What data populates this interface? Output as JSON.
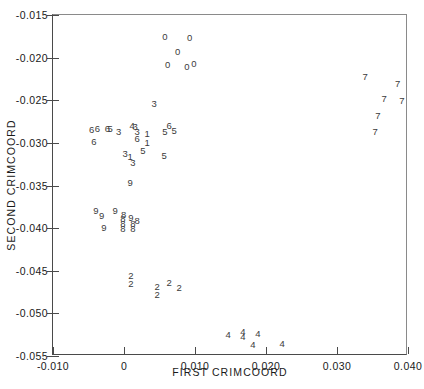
{
  "chart_data": {
    "type": "scatter",
    "title": "",
    "xlabel": "FIRST CRIMCOORD",
    "ylabel": "SECOND CRIMCOORD",
    "xlim": [
      -0.01,
      0.04
    ],
    "ylim": [
      -0.055,
      -0.015
    ],
    "xticks": [
      -0.01,
      0.0,
      0.01,
      0.02,
      0.03,
      0.04
    ],
    "xticklabels": [
      "-0.010",
      "0",
      "0.010",
      "0.020",
      "0.030",
      "0.040"
    ],
    "yticks": [
      -0.015,
      -0.02,
      -0.025,
      -0.03,
      -0.035,
      -0.04,
      -0.045,
      -0.05,
      -0.055
    ],
    "yticklabels": [
      "-0.015",
      "-0.020",
      "-0.025",
      "-0.030",
      "-0.035",
      "-0.040",
      "-0.045",
      "-0.050",
      "-0.055"
    ],
    "grid": false,
    "legend": false,
    "marker_style": "group-digit-label",
    "groups": [
      "0",
      "1",
      "2",
      "3",
      "4",
      "5",
      "6",
      "7",
      "8",
      "9"
    ],
    "points": [
      {
        "label": "0",
        "x": 0.0059,
        "y": -0.01765
      },
      {
        "label": "0",
        "x": 0.0094,
        "y": -0.01777
      },
      {
        "label": "0",
        "x": 0.0077,
        "y": -0.01942
      },
      {
        "label": "0",
        "x": 0.0063,
        "y": -0.02094
      },
      {
        "label": "0",
        "x": 0.009,
        "y": -0.02118
      },
      {
        "label": "0",
        "x": 0.01,
        "y": -0.02083
      },
      {
        "label": "3",
        "x": 0.0044,
        "y": -0.02552
      },
      {
        "label": "6",
        "x": -0.0044,
        "y": -0.02864
      },
      {
        "label": "6",
        "x": -0.0036,
        "y": -0.02845
      },
      {
        "label": "6",
        "x": -0.0022,
        "y": -0.02845
      },
      {
        "label": "5",
        "x": -0.0018,
        "y": -0.02845
      },
      {
        "label": "3",
        "x": -0.0006,
        "y": -0.02881
      },
      {
        "label": "4",
        "x": 0.0013,
        "y": -0.0281
      },
      {
        "label": "3",
        "x": 0.0017,
        "y": -0.02822
      },
      {
        "label": "3",
        "x": 0.002,
        "y": -0.02881
      },
      {
        "label": "1",
        "x": 0.0034,
        "y": -0.02905
      },
      {
        "label": "5",
        "x": 0.0059,
        "y": -0.02881
      },
      {
        "label": "6",
        "x": 0.0065,
        "y": -0.0281
      },
      {
        "label": "5",
        "x": 0.0072,
        "y": -0.02869
      },
      {
        "label": "6",
        "x": -0.0041,
        "y": -0.02998
      },
      {
        "label": "6",
        "x": 0.002,
        "y": -0.02963
      },
      {
        "label": "1",
        "x": 0.0034,
        "y": -0.0301
      },
      {
        "label": "5",
        "x": 0.0028,
        "y": -0.03104
      },
      {
        "label": "3",
        "x": 0.0003,
        "y": -0.03139
      },
      {
        "label": "1",
        "x": 0.001,
        "y": -0.03175
      },
      {
        "label": "5",
        "x": 0.0058,
        "y": -0.03163
      },
      {
        "label": "3",
        "x": 0.0014,
        "y": -0.03245
      },
      {
        "label": "9",
        "x": 0.001,
        "y": -0.0348
      },
      {
        "label": "9",
        "x": -0.0038,
        "y": -0.03815
      },
      {
        "label": "9",
        "x": -0.0011,
        "y": -0.03815
      },
      {
        "label": "8",
        "x": 0.0001,
        "y": -0.03862
      },
      {
        "label": "9",
        "x": -0.003,
        "y": -0.03874
      },
      {
        "label": "8",
        "x": 0.0,
        "y": -0.03909
      },
      {
        "label": "9",
        "x": 0.0011,
        "y": -0.03897
      },
      {
        "label": "8",
        "x": 0.002,
        "y": -0.03933
      },
      {
        "label": "8",
        "x": 0.0,
        "y": -0.03968
      },
      {
        "label": "8",
        "x": 0.0014,
        "y": -0.03968
      },
      {
        "label": "9",
        "x": -0.0027,
        "y": -0.04015
      },
      {
        "label": "8",
        "x": 0.0,
        "y": -0.04027
      },
      {
        "label": "8",
        "x": 0.0014,
        "y": -0.04027
      },
      {
        "label": "2",
        "x": 0.0011,
        "y": -0.04578
      },
      {
        "label": "2",
        "x": 0.0011,
        "y": -0.04672
      },
      {
        "label": "2",
        "x": 0.0048,
        "y": -0.04707
      },
      {
        "label": "2",
        "x": 0.0065,
        "y": -0.0466
      },
      {
        "label": "2",
        "x": 0.0079,
        "y": -0.04719
      },
      {
        "label": "2",
        "x": 0.0048,
        "y": -0.04801
      },
      {
        "label": "4",
        "x": 0.0148,
        "y": -0.05271
      },
      {
        "label": "4",
        "x": 0.0169,
        "y": -0.05236
      },
      {
        "label": "4",
        "x": 0.0169,
        "y": -0.05294
      },
      {
        "label": "4",
        "x": 0.019,
        "y": -0.05248
      },
      {
        "label": "4",
        "x": 0.0183,
        "y": -0.05388
      },
      {
        "label": "4",
        "x": 0.0224,
        "y": -0.05376
      },
      {
        "label": "7",
        "x": 0.0341,
        "y": -0.02235
      },
      {
        "label": "7",
        "x": 0.0387,
        "y": -0.02317
      },
      {
        "label": "7",
        "x": 0.0368,
        "y": -0.02493
      },
      {
        "label": "7",
        "x": 0.0393,
        "y": -0.02517
      },
      {
        "label": "7",
        "x": 0.0359,
        "y": -0.02693
      },
      {
        "label": "7",
        "x": 0.0355,
        "y": -0.0288
      }
    ]
  }
}
